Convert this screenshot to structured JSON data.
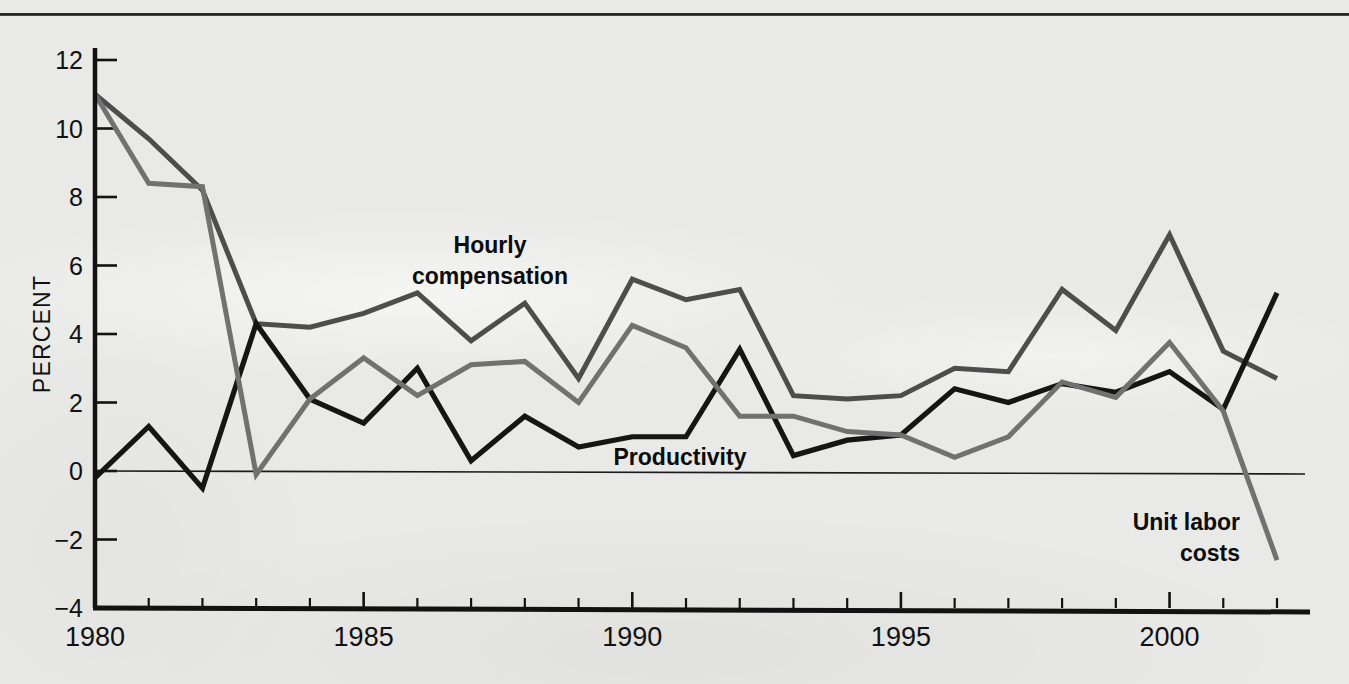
{
  "figure": {
    "background_color": "#e9e9e7",
    "has_top_rule": true
  },
  "axes": {
    "y_axis_title": "PERCENT",
    "y_ticks": [
      "12",
      "10",
      "8",
      "6",
      "4",
      "2",
      "0",
      "−2",
      "−4"
    ],
    "y_tick_values": [
      12,
      10,
      8,
      6,
      4,
      2,
      0,
      -2,
      -4
    ],
    "x_ticks": [
      "1980",
      "1985",
      "1990",
      "1995",
      "2000"
    ],
    "x_tick_values": [
      1980,
      1985,
      1990,
      1995,
      2000
    ],
    "x_min": 1980,
    "x_max": 2002,
    "y_min": -4,
    "y_max": 12
  },
  "annotations": [
    {
      "name": "hourly-compensation-label",
      "line1": "Hourly",
      "line2": "compensation"
    },
    {
      "name": "productivity-label",
      "line1": "Productivity",
      "line2": ""
    },
    {
      "name": "unit-labor-costs-label",
      "line1": "Unit labor",
      "line2": "costs"
    }
  ],
  "chart_data": {
    "type": "line",
    "title": "",
    "subtitle": "",
    "xlabel": "",
    "ylabel": "PERCENT",
    "xlim": [
      1980,
      2002
    ],
    "ylim": [
      -4,
      12
    ],
    "grid": false,
    "legend": "inline-annotations",
    "x": [
      1980,
      1981,
      1982,
      1983,
      1984,
      1985,
      1986,
      1987,
      1988,
      1989,
      1990,
      1991,
      1992,
      1993,
      1994,
      1995,
      1996,
      1997,
      1998,
      1999,
      2000,
      2001,
      2002
    ],
    "series": [
      {
        "name": "Hourly compensation",
        "color": "#4d4d4d",
        "stroke_width": 5.0,
        "values": [
          11.0,
          9.7,
          8.2,
          4.3,
          4.2,
          4.6,
          5.2,
          3.8,
          4.9,
          2.7,
          5.6,
          5.0,
          5.3,
          2.2,
          2.1,
          2.2,
          3.0,
          2.9,
          5.3,
          4.1,
          6.9,
          3.5,
          2.7
        ]
      },
      {
        "name": "Productivity",
        "color": "#151515",
        "stroke_width": 5.2,
        "values": [
          -0.2,
          1.3,
          -0.5,
          4.3,
          2.1,
          1.4,
          3.0,
          0.3,
          1.6,
          0.7,
          1.0,
          1.0,
          3.55,
          0.45,
          0.9,
          1.05,
          2.4,
          2.0,
          2.55,
          2.3,
          2.9,
          1.8,
          5.2
        ]
      },
      {
        "name": "Unit labor costs",
        "color": "#717171",
        "stroke_width": 5.0,
        "values": [
          11.0,
          8.4,
          8.3,
          -0.1,
          2.1,
          3.3,
          2.2,
          3.1,
          3.2,
          2.0,
          4.25,
          3.6,
          1.6,
          1.6,
          1.15,
          1.05,
          0.4,
          1.0,
          2.6,
          2.15,
          3.75,
          1.75,
          -2.6
        ]
      }
    ]
  }
}
